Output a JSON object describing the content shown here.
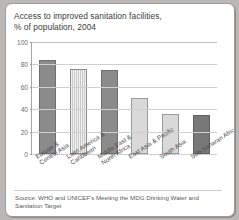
{
  "card": {
    "title_lines": [
      "Access to improved sanitation facilities,",
      "% of population, 2004"
    ],
    "source_lines": [
      "Source: WHO and UNICEF's Meeting the MDG Drinking Water and",
      "Sanitation Target"
    ]
  },
  "chart_data": {
    "type": "bar",
    "title": "Access to improved sanitation facilities, % of population, 2004",
    "xlabel": "",
    "ylabel": "% of population",
    "ylim": [
      0,
      100
    ],
    "yticks": [
      0,
      20,
      40,
      60,
      80,
      100
    ],
    "ytick_labels": [
      "0",
      "20",
      "40",
      "60",
      "80",
      "100"
    ],
    "grid": true,
    "legend": "none",
    "categories": [
      "Europe &\nCentral Asia",
      "Latin America &\nCaribbean",
      "Middle East &\nNorth Africa",
      "East Asia & Pacific",
      "South Asia",
      "Sub-Saharan Africa"
    ],
    "category_lines": [
      [
        "Europe &",
        "Central Asia"
      ],
      [
        "Latin America &",
        "Caribbean"
      ],
      [
        "Middle East &",
        "North Africa"
      ],
      [
        "East Asia & Pacific"
      ],
      [
        "South Asia"
      ],
      [
        "Sub-Saharan Africa"
      ]
    ],
    "values": [
      84,
      76,
      75,
      50,
      36,
      35
    ],
    "bar_styles": [
      "dark",
      "hatch",
      "dark",
      "light",
      "light",
      "darker"
    ],
    "colors": {
      "dark": "#8b8b8b",
      "hatch": "#c9c9c9",
      "light": "#d9d9d9",
      "darker": "#787878",
      "axis": "#a6a6a6",
      "grid": "#cfcfcf",
      "text": "#3c3c3c",
      "page_background": "#b9b8b6",
      "card_background": "#ffffff"
    }
  }
}
